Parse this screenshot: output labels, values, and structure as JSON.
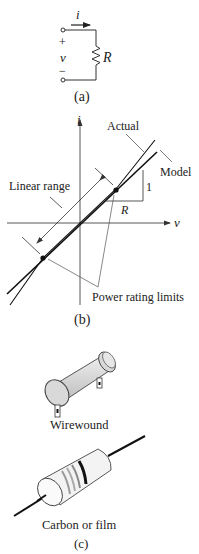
{
  "figure_a": {
    "current_label": "i",
    "plus_label": "+",
    "voltage_label": "v",
    "minus_label": "−",
    "resistor_label": "R",
    "caption": "(a)"
  },
  "figure_b": {
    "y_axis_label": "i",
    "x_axis_label": "v",
    "actual_label": "Actual",
    "model_label": "Model",
    "linear_range_label": "Linear range",
    "slope_rise_label": "1",
    "slope_run_label": "R",
    "power_limits_label": "Power rating limits",
    "caption": "(b)"
  },
  "figure_c": {
    "wirewound_label": "Wirewound",
    "carbon_label": "Carbon or film",
    "caption": "(c)"
  },
  "colors": {
    "ink": "#222222",
    "thin_line": "#555555",
    "body_fill": "#dcdcdc",
    "body_shade": "#c4c4c4"
  }
}
